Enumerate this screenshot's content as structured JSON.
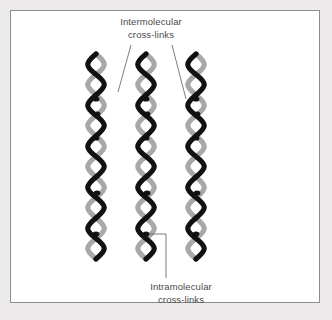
{
  "figure": {
    "background_color": "#eceaea",
    "panel_color": "#ffffff",
    "panel_border_color": "#8d8d8d"
  },
  "labels": {
    "intermolecular": {
      "line1": "Intermolecular",
      "line2": "cross-links",
      "color": "#4a4a4a"
    },
    "intramolecular": {
      "line1": "Intramolecular",
      "line2": "cross-links",
      "color": "#4a4a4a"
    }
  },
  "diagram": {
    "strand_dark_color": "#111111",
    "strand_light_color": "#a8a8a8",
    "crosslink_dot_color": "#111111",
    "leader_line_color": "#6e6e6e",
    "column_count": 3,
    "column_x_centers": [
      96,
      146,
      196
    ],
    "helix_repeats_per_column": 5,
    "column_top_y": 54,
    "column_bottom_y": 262,
    "repeat_height": 41,
    "helix_amplitude": 11,
    "crosslink_dots": [
      {
        "column": 0,
        "x": 96,
        "y": 99
      },
      {
        "column": 0,
        "x": 97,
        "y": 114
      },
      {
        "column": 0,
        "x": 96,
        "y": 138
      },
      {
        "column": 0,
        "x": 97,
        "y": 193
      },
      {
        "column": 0,
        "x": 96,
        "y": 234
      },
      {
        "column": 1,
        "x": 146,
        "y": 99
      },
      {
        "column": 1,
        "x": 147,
        "y": 114
      },
      {
        "column": 1,
        "x": 146,
        "y": 138
      },
      {
        "column": 1,
        "x": 147,
        "y": 193
      },
      {
        "column": 1,
        "x": 146,
        "y": 234
      },
      {
        "column": 2,
        "x": 196,
        "y": 99
      },
      {
        "column": 2,
        "x": 197,
        "y": 114
      },
      {
        "column": 2,
        "x": 196,
        "y": 138
      },
      {
        "column": 2,
        "x": 197,
        "y": 193
      },
      {
        "column": 2,
        "x": 196,
        "y": 234
      }
    ],
    "leader_lines": [
      {
        "name": "intermolecular-leader-left",
        "points": "131,45 118,92"
      },
      {
        "name": "intermolecular-leader-right",
        "points": "172,45 186,99"
      },
      {
        "name": "intramolecular-leader",
        "points": "150,234 166,234 166,278"
      }
    ]
  }
}
